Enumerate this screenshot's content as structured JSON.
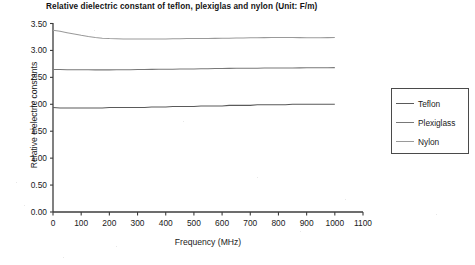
{
  "chart_data": {
    "type": "line",
    "title": "Relative dielectric constant of teflon, plexiglas and nylon (Unit: F/m)",
    "xlabel": "Frequency (MHz)",
    "ylabel": "Relative eielectric constants",
    "xlim": [
      0,
      1100
    ],
    "ylim": [
      0.0,
      3.5
    ],
    "xticks": [
      "0",
      "100",
      "200",
      "300",
      "400",
      "500",
      "600",
      "700",
      "800",
      "900",
      "1000",
      "1100"
    ],
    "xtick_values": [
      0,
      100,
      200,
      300,
      400,
      500,
      600,
      700,
      800,
      900,
      1000,
      1100
    ],
    "yticks": [
      "0.00",
      "0.50",
      "1.00",
      "1.50",
      "2.00",
      "2.50",
      "3.00",
      "3.50"
    ],
    "ytick_values": [
      0.0,
      0.5,
      1.0,
      1.5,
      2.0,
      2.5,
      3.0,
      3.5
    ],
    "grid": false,
    "legend_position": "right",
    "x": [
      0,
      25,
      50,
      75,
      100,
      125,
      150,
      175,
      200,
      225,
      250,
      275,
      300,
      325,
      350,
      375,
      400,
      425,
      450,
      475,
      500,
      525,
      550,
      575,
      600,
      625,
      650,
      675,
      700,
      725,
      750,
      775,
      800,
      825,
      850,
      875,
      900,
      925,
      950,
      975,
      1000
    ],
    "series": [
      {
        "name": "Teflon",
        "color": "#5a5a5a",
        "values": [
          1.94,
          1.93,
          1.93,
          1.93,
          1.93,
          1.93,
          1.93,
          1.93,
          1.94,
          1.94,
          1.94,
          1.94,
          1.94,
          1.94,
          1.95,
          1.95,
          1.95,
          1.96,
          1.96,
          1.96,
          1.96,
          1.97,
          1.97,
          1.97,
          1.97,
          1.98,
          1.98,
          1.98,
          1.98,
          1.99,
          1.99,
          1.99,
          1.99,
          1.99,
          2.0,
          2.0,
          2.0,
          2.0,
          2.0,
          2.0,
          2.0
        ]
      },
      {
        "name": "Plexiglass",
        "color": "#787878",
        "values": [
          2.645,
          2.645,
          2.643,
          2.641,
          2.64,
          2.64,
          2.639,
          2.639,
          2.639,
          2.64,
          2.641,
          2.643,
          2.645,
          2.647,
          2.648,
          2.65,
          2.651,
          2.652,
          2.654,
          2.655,
          2.657,
          2.659,
          2.661,
          2.663,
          2.665,
          2.667,
          2.668,
          2.669,
          2.67,
          2.671,
          2.672,
          2.673,
          2.673,
          2.674,
          2.675,
          2.676,
          2.677,
          2.678,
          2.679,
          2.68,
          2.681
        ]
      },
      {
        "name": "Nylon",
        "color": "#9a9a9a",
        "values": [
          3.375,
          3.355,
          3.33,
          3.305,
          3.28,
          3.258,
          3.24,
          3.228,
          3.22,
          3.216,
          3.214,
          3.213,
          3.212,
          3.212,
          3.212,
          3.213,
          3.214,
          3.216,
          3.218,
          3.22,
          3.221,
          3.222,
          3.223,
          3.224,
          3.226,
          3.228,
          3.23,
          3.232,
          3.234,
          3.236,
          3.238,
          3.239,
          3.24,
          3.24,
          3.239,
          3.238,
          3.237,
          3.237,
          3.237,
          3.238,
          3.24
        ]
      }
    ]
  },
  "legend": {
    "items": [
      {
        "label": "Teflon"
      },
      {
        "label": "Plexiglass"
      },
      {
        "label": "Nylon"
      }
    ]
  }
}
